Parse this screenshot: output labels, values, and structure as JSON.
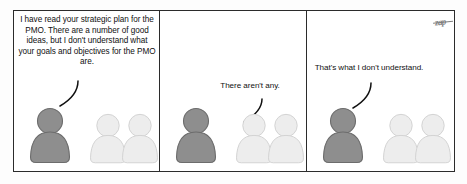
{
  "comic": {
    "title": "PMO strategic plan comic strip",
    "background_color": "#fdfdfd",
    "panel_border_color": "#2b2b2b",
    "signature": "zap",
    "panels": [
      {
        "id": "panel-1",
        "speech": "I have read your strategic plan for the PMO. There are a number of good ideas, but I don't understand what your goals and objectives for the PMO are.",
        "speaker": "dark-figure-left",
        "tail_direction": "down-left",
        "figures": [
          {
            "name": "figure-dark-left",
            "tone": "dark",
            "color": "#8e8e8e",
            "outline": "#6c6c6c"
          },
          {
            "name": "figure-light-middle",
            "tone": "light",
            "color": "#ededed",
            "outline": "#d2d2d2"
          },
          {
            "name": "figure-light-right",
            "tone": "light",
            "color": "#ededed",
            "outline": "#d2d2d2"
          }
        ]
      },
      {
        "id": "panel-2",
        "speech": "There aren't any.",
        "speaker": "light-figure-middle",
        "tail_direction": "down-left",
        "figures": [
          {
            "name": "figure-dark-left",
            "tone": "dark",
            "color": "#8e8e8e",
            "outline": "#6c6c6c"
          },
          {
            "name": "figure-light-middle",
            "tone": "light",
            "color": "#ededed",
            "outline": "#d2d2d2"
          },
          {
            "name": "figure-light-right",
            "tone": "light",
            "color": "#ededed",
            "outline": "#d2d2d2"
          }
        ]
      },
      {
        "id": "panel-3",
        "speech": "That's what I don't understand.",
        "speaker": "dark-figure-left",
        "tail_direction": "down-left",
        "figures": [
          {
            "name": "figure-dark-left",
            "tone": "dark",
            "color": "#8e8e8e",
            "outline": "#6c6c6c"
          },
          {
            "name": "figure-light-middle",
            "tone": "light",
            "color": "#ededed",
            "outline": "#d2d2d2"
          },
          {
            "name": "figure-light-right",
            "tone": "light",
            "color": "#ededed",
            "outline": "#d2d2d2"
          }
        ]
      }
    ]
  }
}
